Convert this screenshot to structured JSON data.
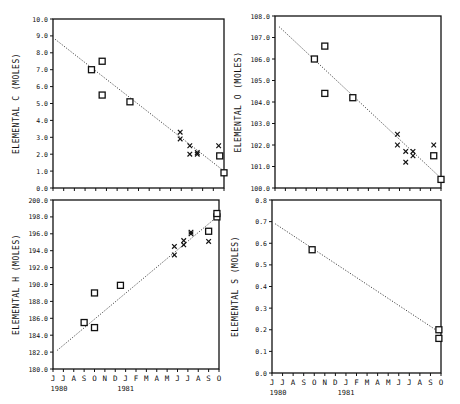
{
  "months": [
    "J",
    "J",
    "A",
    "S",
    "O",
    "N",
    "D",
    "J",
    "F",
    "M",
    "A",
    "M",
    "J",
    "J",
    "A",
    "S",
    "O"
  ],
  "years": [
    {
      "label": "1980",
      "index": 0
    },
    {
      "label": "1981",
      "index": 7
    }
  ],
  "chart_data": [
    {
      "id": "carbon",
      "type": "scatter",
      "title": "",
      "xlabel": "",
      "ylabel": "ELEMENTAL C (MOLES)",
      "ylim": [
        0.0,
        10.0
      ],
      "ytick_step": 1.0,
      "ytick_decimals": 1,
      "grid": false,
      "frame": {
        "x": 53,
        "y": 19,
        "w": 171,
        "h": 169
      },
      "series": [
        {
          "name": "squares",
          "marker": "square",
          "points": [
            [
              3.6,
              7.0
            ],
            [
              4.6,
              7.5
            ],
            [
              4.6,
              5.5
            ],
            [
              7.2,
              5.1
            ],
            [
              15.6,
              1.9
            ],
            [
              16.0,
              0.9
            ]
          ]
        },
        {
          "name": "crosses",
          "marker": "x",
          "points": [
            [
              11.9,
              3.3
            ],
            [
              11.9,
              2.9
            ],
            [
              12.8,
              2.5
            ],
            [
              12.8,
              2.0
            ],
            [
              13.5,
              2.1
            ],
            [
              13.5,
              2.0
            ],
            [
              15.5,
              2.5
            ]
          ]
        }
      ],
      "trend": [
        [
          0.2,
          8.8
        ],
        [
          16.0,
          1.0
        ]
      ]
    },
    {
      "id": "oxygen",
      "type": "scatter",
      "title": "",
      "xlabel": "",
      "ylabel": "ELEMENTAL O (MOLES)",
      "ylim": [
        100.0,
        108.0
      ],
      "ytick_step": 1.0,
      "ytick_decimals": 1,
      "grid": false,
      "frame": {
        "x": 275,
        "y": 16,
        "w": 166,
        "h": 172
      },
      "series": [
        {
          "name": "squares",
          "marker": "square",
          "points": [
            [
              3.8,
              106.0
            ],
            [
              4.8,
              106.6
            ],
            [
              4.8,
              104.4
            ],
            [
              7.5,
              104.2
            ],
            [
              15.3,
              101.5
            ],
            [
              16.0,
              100.4
            ]
          ]
        },
        {
          "name": "crosses",
          "marker": "x",
          "points": [
            [
              11.8,
              102.5
            ],
            [
              11.8,
              102.0
            ],
            [
              12.6,
              101.7
            ],
            [
              12.6,
              101.2
            ],
            [
              13.3,
              101.7
            ],
            [
              13.3,
              101.5
            ],
            [
              15.3,
              102.0
            ]
          ]
        }
      ],
      "trend": [
        [
          0.4,
          107.5
        ],
        [
          15.9,
          100.5
        ]
      ]
    },
    {
      "id": "hydrogen",
      "type": "scatter",
      "title": "",
      "xlabel": "",
      "ylabel": "ELEMENTAL H (MOLES)",
      "ylim": [
        180.0,
        200.0
      ],
      "ytick_step": 2.0,
      "ytick_decimals": 1,
      "grid": false,
      "frame": {
        "x": 53,
        "y": 200,
        "w": 166,
        "h": 169
      },
      "series": [
        {
          "name": "squares",
          "marker": "square",
          "points": [
            [
              3.0,
              185.5
            ],
            [
              4.0,
              189.0
            ],
            [
              4.0,
              184.9
            ],
            [
              6.5,
              189.9
            ],
            [
              15.0,
              196.3
            ],
            [
              15.8,
              198.0
            ],
            [
              15.8,
              198.4
            ]
          ]
        },
        {
          "name": "crosses",
          "marker": "x",
          "points": [
            [
              11.7,
              194.5
            ],
            [
              11.7,
              193.5
            ],
            [
              12.6,
              195.2
            ],
            [
              12.6,
              194.7
            ],
            [
              13.3,
              196.2
            ],
            [
              13.3,
              196.0
            ],
            [
              15.0,
              195.1
            ]
          ]
        }
      ],
      "trend": [
        [
          0.4,
          182.2
        ],
        [
          15.8,
          198.0
        ]
      ]
    },
    {
      "id": "sulfur",
      "type": "scatter",
      "title": "",
      "xlabel": "",
      "ylabel": "ELEMENTAL S (MOLES)",
      "ylim": [
        0.0,
        0.8
      ],
      "ytick_step": 0.1,
      "ytick_decimals": 1,
      "grid": false,
      "frame": {
        "x": 272,
        "y": 200,
        "w": 169,
        "h": 173
      },
      "series": [
        {
          "name": "squares",
          "marker": "square",
          "points": [
            [
              3.8,
              0.57
            ],
            [
              15.8,
              0.2
            ],
            [
              15.8,
              0.16
            ]
          ]
        }
      ],
      "trend": [
        [
          0.3,
          0.69
        ],
        [
          15.8,
          0.19
        ]
      ]
    }
  ]
}
